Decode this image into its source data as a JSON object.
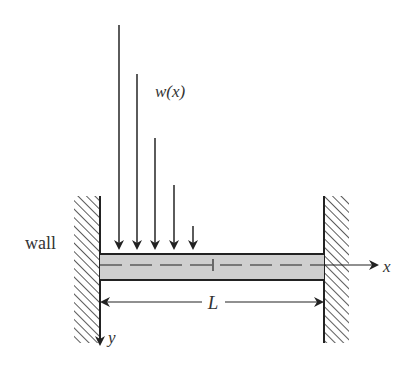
{
  "diagram": {
    "type": "fixed-fixed beam with distributed load",
    "labels": {
      "wall": "wall",
      "load": "w(x)",
      "x_axis": "x",
      "y_axis": "y",
      "length": "L"
    },
    "colors": {
      "line": "#222222",
      "beam_fill": "#cfcfcf",
      "background": "#ffffff"
    },
    "load_arrows": [
      {
        "x": 119,
        "y_start": 25
      },
      {
        "x": 137,
        "y_start": 74
      },
      {
        "x": 155,
        "y_start": 138
      },
      {
        "x": 174,
        "y_start": 185
      },
      {
        "x": 193,
        "y_start": 226
      }
    ]
  }
}
